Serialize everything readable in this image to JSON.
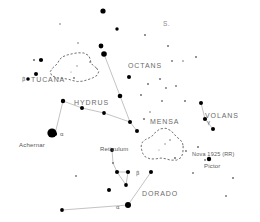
{
  "chart": {
    "background_color": "#ffffff",
    "star_color": "#000000",
    "line_color": "#b4b4b4",
    "label_color": "#5a5a5a",
    "width": 260,
    "height": 222
  },
  "chart_data": {
    "type": "scatter",
    "xlabel": "",
    "ylabel": "",
    "xlim": [
      0,
      260
    ],
    "ylim": [
      0,
      222
    ],
    "grid": false,
    "legend": false,
    "note": "Star map; x/y are pixel positions on the chart, r is plotted dot radius encoding brightness (larger = brighter).",
    "series": [
      {
        "name": "stars",
        "points": [
          {
            "x": 103,
            "y": 11,
            "r": 2.6
          },
          {
            "x": 117,
            "y": 29,
            "r": 1.7
          },
          {
            "x": 145,
            "y": 35,
            "r": 1.0
          },
          {
            "x": 101,
            "y": 46,
            "r": 2.4
          },
          {
            "x": 104,
            "y": 54,
            "r": 2.8
          },
          {
            "x": 34,
            "y": 60,
            "r": 1.1
          },
          {
            "x": 41,
            "y": 60,
            "r": 2.1
          },
          {
            "x": 168,
            "y": 46,
            "r": 1.0
          },
          {
            "x": 172,
            "y": 61,
            "r": 0.9
          },
          {
            "x": 183,
            "y": 61,
            "r": 0.8
          },
          {
            "x": 196,
            "y": 57,
            "r": 1.0
          },
          {
            "x": 36,
            "y": 74,
            "r": 2.0
          },
          {
            "x": 28,
            "y": 79,
            "r": 1.8
          },
          {
            "x": 74,
            "y": 78,
            "r": 0.9
          },
          {
            "x": 129,
            "y": 77,
            "r": 2.0
          },
          {
            "x": 148,
            "y": 84,
            "r": 1.0
          },
          {
            "x": 160,
            "y": 79,
            "r": 1.0
          },
          {
            "x": 166,
            "y": 88,
            "r": 0.9
          },
          {
            "x": 176,
            "y": 86,
            "r": 0.9
          },
          {
            "x": 120,
            "y": 96,
            "r": 2.3
          },
          {
            "x": 141,
            "y": 95,
            "r": 1.0
          },
          {
            "x": 63,
            "y": 101,
            "r": 2.2
          },
          {
            "x": 82,
            "y": 108,
            "r": 2.0
          },
          {
            "x": 104,
            "y": 113,
            "r": 1.9
          },
          {
            "x": 201,
            "y": 103,
            "r": 2.0
          },
          {
            "x": 205,
            "y": 119,
            "r": 2.1
          },
          {
            "x": 213,
            "y": 129,
            "r": 2.0
          },
          {
            "x": 185,
            "y": 101,
            "r": 1.0
          },
          {
            "x": 162,
            "y": 101,
            "r": 0.9
          },
          {
            "x": 144,
            "y": 119,
            "r": 1.0
          },
          {
            "x": 130,
            "y": 122,
            "r": 2.0
          },
          {
            "x": 137,
            "y": 131,
            "r": 2.0
          },
          {
            "x": 52,
            "y": 133,
            "r": 4.6
          },
          {
            "x": 55,
            "y": 134,
            "r": 2.1
          },
          {
            "x": 175,
            "y": 158,
            "r": 1.0
          },
          {
            "x": 186,
            "y": 151,
            "r": 0.9
          },
          {
            "x": 170,
            "y": 140,
            "r": 0.8
          },
          {
            "x": 198,
            "y": 147,
            "r": 1.0
          },
          {
            "x": 209,
            "y": 159,
            "r": 2.2
          },
          {
            "x": 205,
            "y": 160,
            "r": 0.9
          },
          {
            "x": 112,
            "y": 150,
            "r": 1.9
          },
          {
            "x": 113,
            "y": 163,
            "r": 1.0
          },
          {
            "x": 117,
            "y": 172,
            "r": 2.0
          },
          {
            "x": 128,
            "y": 172,
            "r": 2.1
          },
          {
            "x": 126,
            "y": 185,
            "r": 1.9
          },
          {
            "x": 151,
            "y": 172,
            "r": 2.0
          },
          {
            "x": 109,
            "y": 190,
            "r": 2.0
          },
          {
            "x": 128,
            "y": 205,
            "r": 3.0
          },
          {
            "x": 62,
            "y": 210,
            "r": 1.9
          },
          {
            "x": 233,
            "y": 178,
            "r": 1.0
          },
          {
            "x": 226,
            "y": 196,
            "r": 0.9
          },
          {
            "x": 76,
            "y": 176,
            "r": 0.9
          },
          {
            "x": 90,
            "y": 62,
            "r": 0.8
          },
          {
            "x": 150,
            "y": 112,
            "r": 0.8
          },
          {
            "x": 193,
            "y": 173,
            "r": 0.9
          },
          {
            "x": 60,
            "y": 24,
            "r": 0.8
          },
          {
            "x": 78,
            "y": 43,
            "r": 0.8
          }
        ]
      }
    ],
    "constellation_lines": [
      {
        "from": [
          104,
          54
        ],
        "to": [
          130,
          122
        ]
      },
      {
        "from": [
          63,
          101
        ],
        "to": [
          82,
          108
        ]
      },
      {
        "from": [
          82,
          108
        ],
        "to": [
          104,
          113
        ]
      },
      {
        "from": [
          104,
          113
        ],
        "to": [
          130,
          122
        ]
      },
      {
        "from": [
          130,
          122
        ],
        "to": [
          137,
          131
        ]
      },
      {
        "from": [
          55,
          134
        ],
        "to": [
          63,
          101
        ]
      },
      {
        "from": [
          112,
          150
        ],
        "to": [
          113,
          163
        ]
      },
      {
        "from": [
          113,
          163
        ],
        "to": [
          117,
          172
        ]
      },
      {
        "from": [
          117,
          172
        ],
        "to": [
          128,
          172
        ]
      },
      {
        "from": [
          117,
          172
        ],
        "to": [
          126,
          185
        ]
      },
      {
        "from": [
          128,
          172
        ],
        "to": [
          126,
          185
        ]
      },
      {
        "from": [
          151,
          172
        ],
        "to": [
          128,
          205
        ]
      },
      {
        "from": [
          128,
          205
        ],
        "to": [
          62,
          210
        ]
      },
      {
        "from": [
          201,
          103
        ],
        "to": [
          205,
          119
        ]
      },
      {
        "from": [
          205,
          119
        ],
        "to": [
          213,
          129
        ]
      }
    ],
    "nebula_outlines": [
      {
        "name": "Small Magellanic Cloud",
        "cx": 75,
        "cy": 68,
        "rx": 22,
        "ry": 14
      },
      {
        "name": "Large Magellanic Cloud",
        "cx": 163,
        "cy": 146,
        "rx": 21,
        "ry": 15
      }
    ]
  },
  "labels": {
    "constellations": [
      {
        "text": "OCTANS",
        "x": 128,
        "y": 62
      },
      {
        "text": "TUCANA",
        "x": 31,
        "y": 76
      },
      {
        "text": "HYDRUS",
        "x": 74,
        "y": 99
      },
      {
        "text": "MENSA",
        "x": 150,
        "y": 118
      },
      {
        "text": "VOLANS",
        "x": 205,
        "y": 112
      },
      {
        "text": "DORADO",
        "x": 142,
        "y": 190
      }
    ],
    "stars": [
      {
        "text": "Achernar",
        "x": 19,
        "y": 142
      },
      {
        "text": "Reticulum",
        "x": 100,
        "y": 146
      },
      {
        "text": "Pictor",
        "x": 204,
        "y": 163
      }
    ],
    "objects": [
      {
        "text": "Nova 1925 (RR)",
        "x": 192,
        "y": 152
      }
    ],
    "pole": {
      "text": "S.",
      "x": 163,
      "y": 21
    },
    "greek": [
      {
        "text": "β",
        "x": 22,
        "y": 77
      },
      {
        "text": "α",
        "x": 60,
        "y": 132
      },
      {
        "text": "γ",
        "x": 207,
        "y": 120
      },
      {
        "text": "β",
        "x": 136,
        "y": 171
      },
      {
        "text": "α",
        "x": 116,
        "y": 205
      }
    ]
  }
}
